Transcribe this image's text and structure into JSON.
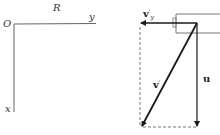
{
  "left_diagram": {
    "frame_label": "R",
    "origin_label": "O",
    "y_axis_label": "y",
    "x_axis_label": "x"
  },
  "right_diagram": {
    "vectors": [
      {
        "id": "vy_prime",
        "label": "v",
        "prime": "′",
        "subscript": "y",
        "direction": "left"
      },
      {
        "id": "v_prime",
        "label": "v",
        "prime": "′",
        "direction": "down-left"
      },
      {
        "id": "u",
        "label": "u",
        "direction": "down"
      }
    ]
  },
  "colors": {
    "line": "#555555",
    "arrow": "#1a1a1a",
    "dashed": "#666666"
  }
}
